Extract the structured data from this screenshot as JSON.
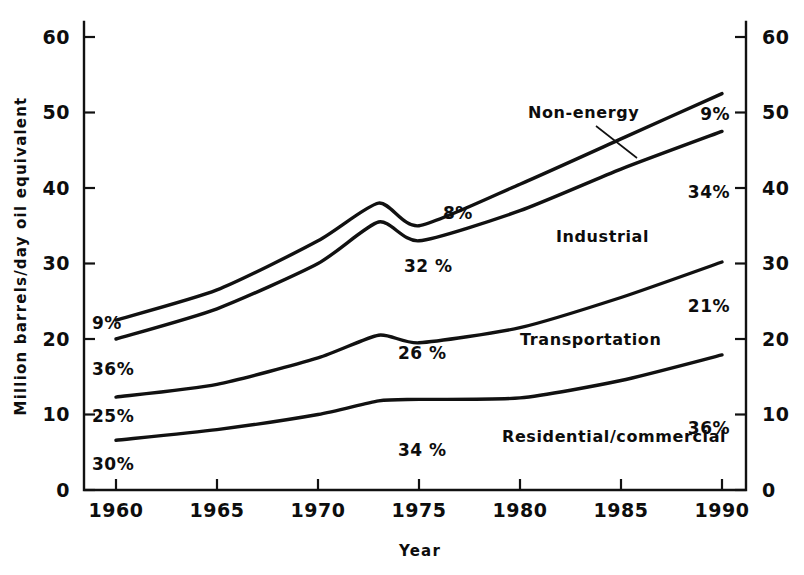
{
  "chart_data": {
    "type": "line",
    "title": "",
    "xlabel": "Year",
    "ylabel": "Million barrels/day oil equivalent",
    "xlim": [
      1960,
      1990
    ],
    "ylim": [
      0,
      62
    ],
    "yticks": [
      0,
      10,
      20,
      30,
      40,
      50,
      60
    ],
    "xticks": [
      1960,
      1965,
      1970,
      1975,
      1980,
      1985,
      1990
    ],
    "grid": false,
    "legend_position": "inline-labels",
    "note": "Cumulative stacked boundary curves; labels name the band below each upper boundary.",
    "x": [
      1960,
      1965,
      1970,
      1973,
      1975,
      1980,
      1985,
      1990
    ],
    "series": [
      {
        "name": "Non-energy",
        "role": "top-boundary (total)",
        "values": [
          22.5,
          26.5,
          33.0,
          38.0,
          35.0,
          40.5,
          46.5,
          52.5
        ]
      },
      {
        "name": "Industrial",
        "role": "boundary below non-energy",
        "values": [
          20.0,
          24.0,
          30.0,
          35.5,
          33.0,
          37.0,
          42.5,
          47.5
        ]
      },
      {
        "name": "Transportation",
        "role": "boundary below industrial",
        "values": [
          12.3,
          14.0,
          17.5,
          20.5,
          19.5,
          21.5,
          25.5,
          30.2
        ]
      },
      {
        "name": "Residential/commercial",
        "role": "bottom boundary",
        "values": [
          6.6,
          8.0,
          10.0,
          11.8,
          12.0,
          12.2,
          14.5,
          17.9
        ]
      }
    ],
    "left_share_labels": [
      {
        "text": "9%",
        "at_value": 21.8
      },
      {
        "text": "36%",
        "at_value": 17.2
      },
      {
        "text": "25%",
        "at_value": 10.0
      },
      {
        "text": "30%",
        "at_value": 4.2
      }
    ],
    "right_share_labels": [
      {
        "text": "9%",
        "at_value": 50.2
      },
      {
        "text": "34%",
        "at_value": 39.8
      },
      {
        "text": "21%",
        "at_value": 25.8
      },
      {
        "text": "36%",
        "at_value": 9.8
      }
    ],
    "inline_share_labels": [
      {
        "text": "8%",
        "year": 1977.5,
        "at_value": 36.0
      },
      {
        "text": "32 %",
        "year": 1974.5,
        "at_value": 30.0
      },
      {
        "text": "26 %",
        "year": 1974.0,
        "at_value": 18.5
      },
      {
        "text": "34 %",
        "year": 1974.0,
        "at_value": 6.5
      }
    ],
    "series_text_labels": [
      {
        "text": "Non-energy",
        "year": 1983.0,
        "at_value": 56.0,
        "has_leader": true
      },
      {
        "text": "Industrial",
        "year": 1981.5,
        "at_value": 33.0,
        "has_leader": false
      },
      {
        "text": "Transportation",
        "year": 1980.0,
        "at_value": 22.0,
        "has_leader": false
      },
      {
        "text": "Residential/commercial",
        "year": 1980.5,
        "at_value": 8.6,
        "has_leader": false
      }
    ],
    "colors": {
      "ink": "#111111",
      "background": "#ffffff"
    }
  },
  "axes": {
    "y_left": {
      "name": "left-value-axis",
      "title": "Million barrels/day oil equivalent",
      "ticks": [
        "0",
        "10",
        "20",
        "30",
        "40",
        "50",
        "60"
      ]
    },
    "y_right": {
      "name": "right-value-axis",
      "ticks": [
        "0",
        "10",
        "20",
        "30",
        "40",
        "50",
        "60"
      ]
    },
    "x_bottom": {
      "name": "year-axis",
      "title": "Year",
      "ticks": [
        "1960",
        "1965",
        "1970",
        "1975",
        "1980",
        "1985",
        "1990"
      ]
    }
  },
  "ticks": {
    "y0": "0",
    "y10": "10",
    "y20": "20",
    "y30": "30",
    "y40": "40",
    "y50": "50",
    "y60": "60",
    "ry0": "0",
    "ry10": "10",
    "ry20": "20",
    "ry30": "30",
    "ry40": "40",
    "ry50": "50",
    "ry60": "60",
    "x1960": "1960",
    "x1965": "1965",
    "x1970": "1970",
    "x1975": "1975",
    "x1980": "1980",
    "x1985": "1985",
    "x1990": "1990"
  },
  "annotations": {
    "left_pct_1": "9%",
    "left_pct_2": "36%",
    "left_pct_3": "25%",
    "left_pct_4": "30%",
    "right_pct_1": "9%",
    "right_pct_2": "34%",
    "right_pct_3": "21%",
    "right_pct_4": "36%",
    "mid_pct_1": "8%",
    "mid_pct_2": "32 %",
    "mid_pct_3": "26 %",
    "mid_pct_4": "34 %",
    "label_nonenergy": "Non-energy",
    "label_industrial": "Industrial",
    "label_transportation": "Transportation",
    "label_residential": "Residential/commercial"
  },
  "titles": {
    "y_axis": "Million barrels/day oil equivalent",
    "x_axis": "Year"
  }
}
